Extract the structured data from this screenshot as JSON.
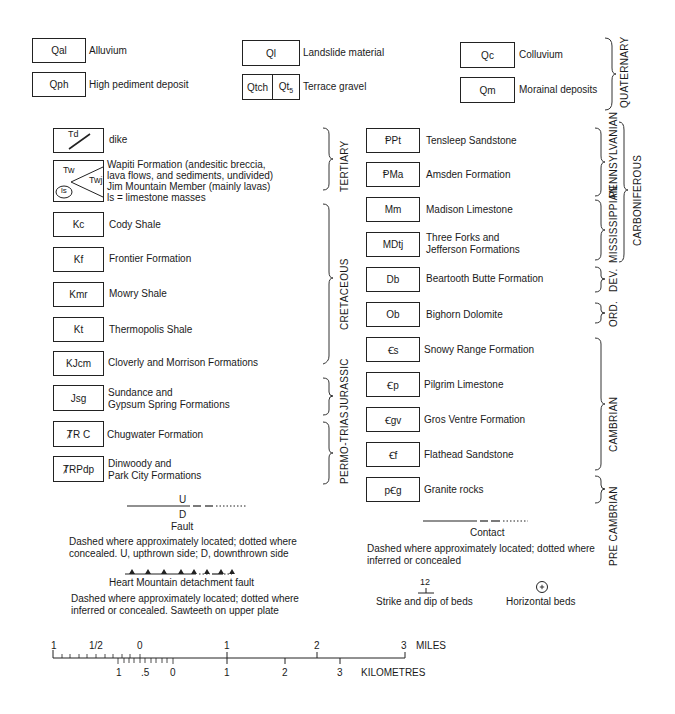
{
  "quaternary": {
    "items": [
      {
        "code": "Qal",
        "name": "Alluvium"
      },
      {
        "code": "Qph",
        "name": "High pediment deposit"
      },
      {
        "code": "Ql",
        "name": "Landslide material"
      },
      {
        "code_a": "Qtch",
        "code_b": "Qt5",
        "name": "Terrace gravel"
      },
      {
        "code": "Qc",
        "name": "Colluvium"
      },
      {
        "code": "Qm",
        "name": "Morainal deposits"
      }
    ],
    "period": "QUATERNARY"
  },
  "left_column": [
    {
      "code": "Td",
      "name": "dike"
    },
    {
      "code_tw": "Tw",
      "code_twj": "Twj",
      "code_ls": "ls",
      "lines": [
        "Wapiti Formation (andesitic breccia,",
        "lava flows, and sediments, undivided)",
        "Jim Mountain Member (mainly lavas)",
        "ls = limestone masses"
      ]
    },
    {
      "code": "Kc",
      "name": "Cody Shale"
    },
    {
      "code": "Kf",
      "name": "Frontier Formation"
    },
    {
      "code": "Kmr",
      "name": "Mowry Shale"
    },
    {
      "code": "Kt",
      "name": "Thermopolis Shale"
    },
    {
      "code": "KJcm",
      "name": "Cloverly and Morrison Formations"
    },
    {
      "code": "Jsg",
      "lines": [
        "Sundance and",
        "Gypsum Spring Formations"
      ]
    },
    {
      "code": "ȾR C",
      "name": "Chugwater Formation"
    },
    {
      "code": "ȾRPdp",
      "lines": [
        "Dinwoody and",
        "Park City Formations"
      ]
    }
  ],
  "left_periods": [
    "TERTIARY",
    "CRETACEOUS",
    "JURASSIC",
    "PERMO-TRIAS"
  ],
  "right_column": [
    {
      "code": "ⱣPt",
      "name": "Tensleep Sandstone"
    },
    {
      "code": "ⱣMa",
      "name": "Amsden Formation"
    },
    {
      "code": "Mm",
      "name": "Madison Limestone"
    },
    {
      "code": "MDtj",
      "lines": [
        "Three Forks and",
        "Jefferson Formations"
      ]
    },
    {
      "code": "Db",
      "name": "Beartooth Butte Formation"
    },
    {
      "code": "Ob",
      "name": "Bighorn Dolomite"
    },
    {
      "code": "Ꞓs",
      "name": "Snowy Range Formation"
    },
    {
      "code": "Ꞓp",
      "name": "Pilgrim Limestone"
    },
    {
      "code": "Ꞓgv",
      "name": "Gros Ventre Formation"
    },
    {
      "code": "Ꞓf",
      "name": "Flathead Sandstone"
    },
    {
      "code": "pꞒg",
      "name": "Granite rocks"
    }
  ],
  "right_periods": {
    "pennsylvanian": "PENNSYLVANIAN",
    "mississippian": "MISSISSIPPIAN",
    "carboniferous": "CARBONIFEROUS",
    "devonian": "DEV.",
    "ordovician": "ORD.",
    "cambrian": "CAMBRIAN",
    "precambrian": "PRE CAMBRIAN"
  },
  "symbols": {
    "fault": {
      "up": "U",
      "down": "D",
      "title": "Fault",
      "desc1": "Dashed where approximately located; dotted where",
      "desc2": "concealed.  U, upthrown side; D, downthrown side"
    },
    "detachment": {
      "title": "Heart Mountain detachment fault",
      "desc1": "Dashed where approximately located; dotted where",
      "desc2": "inferred or concealed.  Sawteeth on upper plate"
    },
    "contact": {
      "title": "Contact",
      "desc1": "Dashed where approximately located; dotted where",
      "desc2": "inferred or concealed"
    },
    "strike_dip": {
      "value": "12",
      "title": "Strike and dip of beds"
    },
    "horizontal": {
      "title": "Horizontal beds"
    }
  },
  "scale": {
    "miles_label": "MILES",
    "km_label": "KILOMETRES",
    "miles_ticks": [
      "1",
      "1/2",
      "0",
      "1",
      "2",
      "3"
    ],
    "km_ticks": [
      "1",
      ".5",
      "0",
      "1",
      "2",
      "3"
    ]
  }
}
